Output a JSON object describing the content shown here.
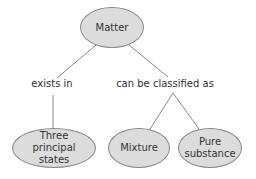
{
  "diagram": {
    "type": "concept-map",
    "root": {
      "label": "Matter"
    },
    "links": [
      {
        "label": "exists in"
      },
      {
        "label": "can be classified as"
      }
    ],
    "children": [
      {
        "label": "Three principal states"
      },
      {
        "label": "Mixture"
      },
      {
        "label": "Pure substance"
      }
    ],
    "colors": {
      "node_fill": "#dcdcdc",
      "node_border": "#8a8a8a",
      "line": "#8a8a8a",
      "text": "#333333"
    }
  }
}
